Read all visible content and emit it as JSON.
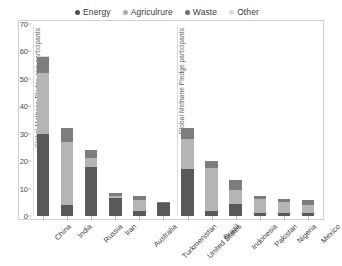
{
  "chart_data": {
    "type": "bar",
    "stacked": true,
    "title": "",
    "xlabel": "",
    "ylabel": "",
    "ylim": [
      0,
      70
    ],
    "yticks": [
      0,
      10,
      20,
      30,
      40,
      50,
      60,
      70
    ],
    "grid": false,
    "legend_position": "top-center",
    "categories": [
      "China",
      "India",
      "Russia",
      "Iran",
      "Australia",
      "Turkmenistan",
      "United States",
      "Brazil",
      "Indonesia",
      "Pakistan",
      "Nigeria",
      "Mexico"
    ],
    "series": [
      {
        "name": "Energy",
        "color": "#595959",
        "values": [
          30.0,
          4.0,
          18.0,
          6.5,
          1.8,
          4.6,
          17.0,
          2.0,
          4.5,
          1.0,
          1.2,
          1.0
        ]
      },
      {
        "name": "Agriculrure",
        "color": "#b5b5b5",
        "values": [
          22.0,
          23.0,
          3.0,
          0.8,
          4.2,
          0.2,
          11.0,
          15.5,
          5.0,
          5.2,
          3.8,
          3.2
        ]
      },
      {
        "name": "Waste",
        "color": "#7d7d7d",
        "values": [
          6.0,
          5.0,
          3.0,
          1.0,
          1.2,
          0.3,
          4.0,
          2.5,
          3.5,
          1.0,
          1.2,
          1.6
        ]
      },
      {
        "name": "Other",
        "color": "#d9d9d9",
        "values": [
          0.3,
          0.2,
          0.2,
          0.1,
          0.1,
          0.1,
          0.2,
          0.2,
          0.2,
          0.1,
          0.1,
          0.1
        ]
      }
    ],
    "annotations": [
      {
        "text": "Global Methane Pledge non-participants",
        "group_start": "China",
        "group_end": "Turkmenistan"
      },
      {
        "text": "Global Methane Pledge participants",
        "group_start": "United States",
        "group_end": "Mexico"
      }
    ]
  },
  "legend": {
    "entries": [
      {
        "label": "Energy",
        "color": "#4d4d4d"
      },
      {
        "label": "Agriculrure",
        "color": "#b0b0b0"
      },
      {
        "label": "Waste",
        "color": "#6e6e6e"
      },
      {
        "label": "Other",
        "color": "#dcdcdc"
      }
    ]
  },
  "axes": {
    "y_tick_labels": [
      "0",
      "10",
      "20",
      "30",
      "40",
      "50",
      "60",
      "70"
    ]
  }
}
